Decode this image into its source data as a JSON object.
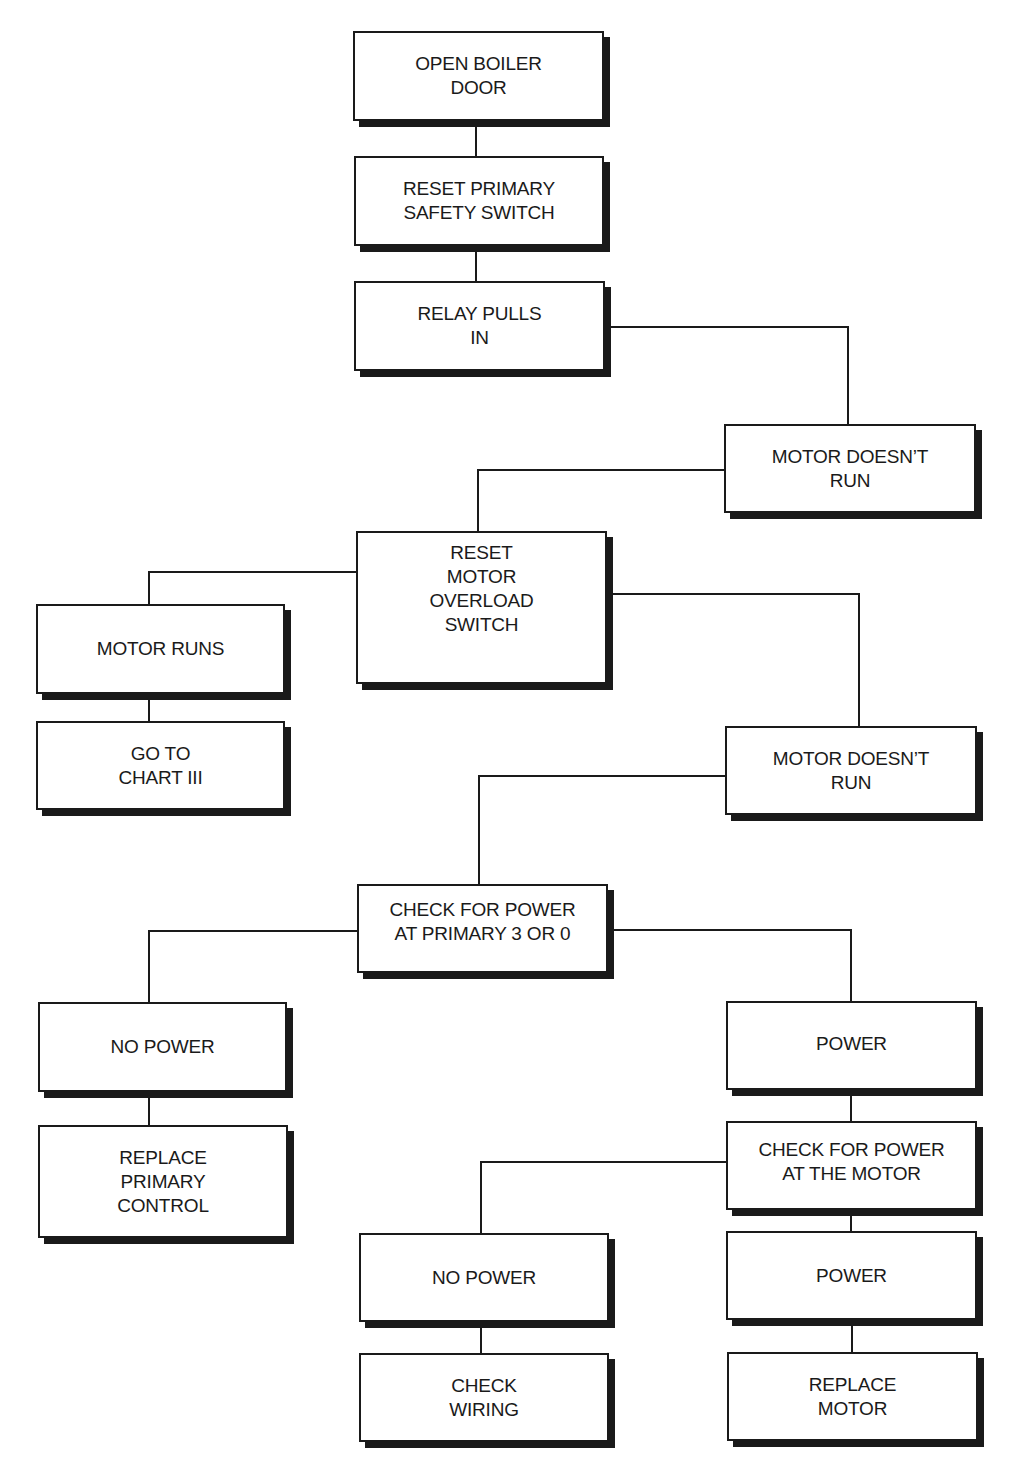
{
  "diagram": {
    "type": "troubleshooting-flowchart",
    "nodes": [
      {
        "id": "open-boiler-door",
        "label": "OPEN BOILER\nDOOR"
      },
      {
        "id": "reset-primary-safety-switch",
        "label": "RESET PRIMARY\nSAFETY SWITCH"
      },
      {
        "id": "relay-pulls-in",
        "label": "RELAY PULLS\nIN"
      },
      {
        "id": "motor-doesnt-run-1",
        "label": "MOTOR DOESN’T\nRUN"
      },
      {
        "id": "reset-motor-overload-switch",
        "label": "RESET\nMOTOR\nOVERLOAD\nSWITCH"
      },
      {
        "id": "motor-runs",
        "label": "MOTOR RUNS"
      },
      {
        "id": "go-to-chart-iii",
        "label": "GO TO\nCHART III"
      },
      {
        "id": "motor-doesnt-run-2",
        "label": "MOTOR DOESN’T\nRUN"
      },
      {
        "id": "check-power-primary",
        "label": "CHECK FOR POWER\nAT PRIMARY 3 OR 0"
      },
      {
        "id": "no-power-1",
        "label": "NO POWER"
      },
      {
        "id": "replace-primary-control",
        "label": "REPLACE\nPRIMARY\nCONTROL"
      },
      {
        "id": "power-1",
        "label": "POWER"
      },
      {
        "id": "check-power-motor",
        "label": "CHECK FOR POWER\nAT THE MOTOR"
      },
      {
        "id": "no-power-2",
        "label": "NO POWER"
      },
      {
        "id": "check-wiring",
        "label": "CHECK\nWIRING"
      },
      {
        "id": "power-2",
        "label": "POWER"
      },
      {
        "id": "replace-motor",
        "label": "REPLACE\nMOTOR"
      }
    ],
    "edges": [
      {
        "from": "open-boiler-door",
        "to": "reset-primary-safety-switch"
      },
      {
        "from": "reset-primary-safety-switch",
        "to": "relay-pulls-in"
      },
      {
        "from": "relay-pulls-in",
        "to": "motor-doesnt-run-1"
      },
      {
        "from": "motor-doesnt-run-1",
        "to": "reset-motor-overload-switch"
      },
      {
        "from": "reset-motor-overload-switch",
        "to": "motor-runs"
      },
      {
        "from": "motor-runs",
        "to": "go-to-chart-iii"
      },
      {
        "from": "reset-motor-overload-switch",
        "to": "motor-doesnt-run-2"
      },
      {
        "from": "motor-doesnt-run-2",
        "to": "check-power-primary"
      },
      {
        "from": "check-power-primary",
        "to": "no-power-1"
      },
      {
        "from": "no-power-1",
        "to": "replace-primary-control"
      },
      {
        "from": "check-power-primary",
        "to": "power-1"
      },
      {
        "from": "power-1",
        "to": "check-power-motor"
      },
      {
        "from": "check-power-motor",
        "to": "no-power-2"
      },
      {
        "from": "no-power-2",
        "to": "check-wiring"
      },
      {
        "from": "check-power-motor",
        "to": "power-2"
      },
      {
        "from": "power-2",
        "to": "replace-motor"
      }
    ]
  }
}
